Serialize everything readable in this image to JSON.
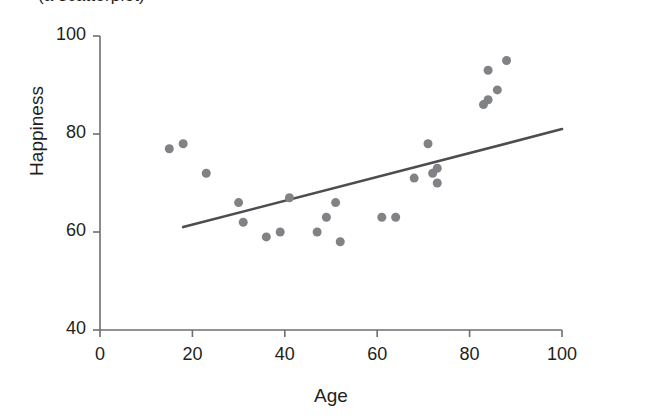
{
  "figure": {
    "clipped_caption_above": "(a scatterplot)",
    "axis_color": "#6d6e70",
    "point_color": "#808285",
    "line_color": "#4d4d4f",
    "text_color": "#231f20",
    "background": "#ffffff"
  },
  "chart_data": {
    "type": "scatter",
    "title": "",
    "xlabel": "Age",
    "ylabel": "Happiness",
    "xlim": [
      0,
      100
    ],
    "ylim": [
      40,
      100
    ],
    "xticks": [
      0,
      20,
      40,
      60,
      80,
      100
    ],
    "yticks": [
      40,
      60,
      80,
      100
    ],
    "xtick_labels": [
      "0",
      "20",
      "40",
      "60",
      "80",
      "100"
    ],
    "ytick_labels": [
      "40",
      "60",
      "80",
      "100"
    ],
    "grid": false,
    "legend": false,
    "marker": "circle",
    "marker_size": 9,
    "points": [
      {
        "x": 15,
        "y": 77
      },
      {
        "x": 18,
        "y": 78
      },
      {
        "x": 23,
        "y": 72
      },
      {
        "x": 30,
        "y": 66
      },
      {
        "x": 31,
        "y": 62
      },
      {
        "x": 36,
        "y": 59
      },
      {
        "x": 39,
        "y": 60
      },
      {
        "x": 41,
        "y": 67
      },
      {
        "x": 47,
        "y": 60
      },
      {
        "x": 49,
        "y": 63
      },
      {
        "x": 51,
        "y": 66
      },
      {
        "x": 52,
        "y": 58
      },
      {
        "x": 61,
        "y": 63
      },
      {
        "x": 64,
        "y": 63
      },
      {
        "x": 68,
        "y": 71
      },
      {
        "x": 71,
        "y": 78
      },
      {
        "x": 72,
        "y": 72
      },
      {
        "x": 73,
        "y": 73
      },
      {
        "x": 73,
        "y": 70
      },
      {
        "x": 83,
        "y": 86
      },
      {
        "x": 84,
        "y": 87
      },
      {
        "x": 84,
        "y": 93
      },
      {
        "x": 86,
        "y": 89
      },
      {
        "x": 88,
        "y": 95
      }
    ],
    "trendline": {
      "present": true,
      "x_start": 18,
      "y_start": 61,
      "x_end": 100,
      "y_end": 81,
      "description": "positive linear best-fit line"
    }
  }
}
